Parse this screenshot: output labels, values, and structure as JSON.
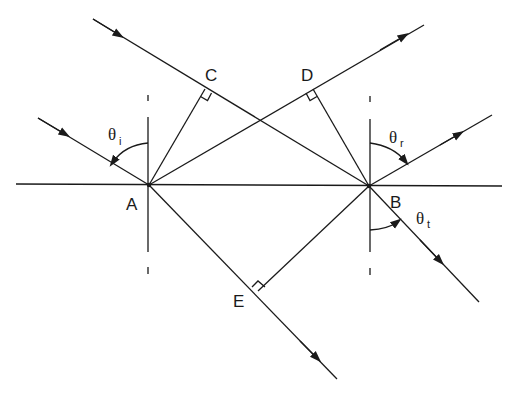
{
  "diagram": {
    "type": "ray-optics-reflection-refraction",
    "points": {
      "A": {
        "label": "A",
        "x": 149,
        "y": 185
      },
      "B": {
        "label": "B",
        "x": 369,
        "y": 186
      },
      "C": {
        "label": "C",
        "x": 205,
        "y": 89
      },
      "D": {
        "label": "D",
        "x": 313,
        "y": 89
      },
      "E": {
        "label": "E",
        "x": 258,
        "y": 291
      }
    },
    "angles": {
      "incidence": {
        "symbol": "θ",
        "subscript": "i"
      },
      "reflection": {
        "symbol": "θ",
        "subscript": "r"
      },
      "transmission": {
        "symbol": "θ",
        "subscript": "t"
      }
    },
    "rays": [
      {
        "name": "incident-ray-to-A",
        "from": [
          38,
          118
        ],
        "to": [
          149,
          185
        ]
      },
      {
        "name": "incident-ray-through-C-to-B",
        "from": [
          93,
          19
        ],
        "to": [
          369,
          186
        ]
      },
      {
        "name": "reflected-ray-from-A-through-D",
        "from": [
          149,
          185
        ],
        "to": [
          424,
          25
        ]
      },
      {
        "name": "reflected-ray-from-B",
        "from": [
          369,
          186
        ],
        "to": [
          492,
          115
        ]
      },
      {
        "name": "transmitted-ray-from-A-through-E",
        "from": [
          149,
          185
        ],
        "to": [
          337,
          379
        ]
      },
      {
        "name": "transmitted-ray-from-B",
        "from": [
          369,
          186
        ],
        "to": [
          479,
          302
        ]
      }
    ]
  }
}
